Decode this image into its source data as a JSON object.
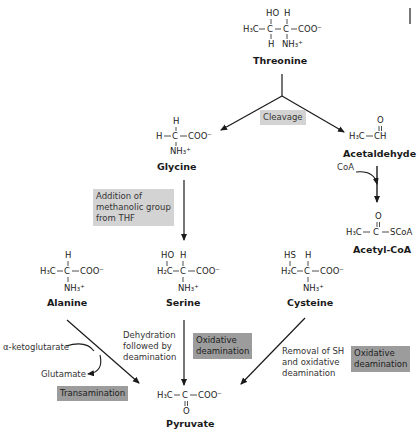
{
  "molecules": {
    "threonine": {
      "name": "Threonine",
      "top": [
        "HO",
        "H"
      ],
      "main": [
        "H₃C",
        "C",
        "C",
        "COO⁻"
      ],
      "bottom": [
        "H",
        "NH₃⁺"
      ]
    },
    "glycine": {
      "name": "Glycine",
      "top": [
        "H"
      ],
      "main": [
        "H",
        "C",
        "COO⁻"
      ],
      "bottom": [
        "NH₃⁺"
      ]
    },
    "acetaldehyde": {
      "name": "Acetaldehyde",
      "top": [
        "O"
      ],
      "main": [
        "H₃C",
        "CH"
      ]
    },
    "acetyl_coa": {
      "name": "Acetyl-CoA",
      "top": [
        "O"
      ],
      "main": [
        "H₃C",
        "C",
        "SCoA"
      ]
    },
    "alanine": {
      "name": "Alanine",
      "top": [
        "H"
      ],
      "main": [
        "H₃C",
        "C",
        "COO⁻"
      ],
      "bottom": [
        "NH₃⁺"
      ]
    },
    "serine": {
      "name": "Serine",
      "top": [
        "HO",
        "H"
      ],
      "main": [
        "H₂C",
        "C",
        "COO⁻"
      ],
      "bottom": [
        "NH₃⁺"
      ]
    },
    "cysteine": {
      "name": "Cysteine",
      "top": [
        "HS",
        "H"
      ],
      "main": [
        "H₂C",
        "C",
        "COO⁻"
      ],
      "bottom": [
        "NH₃⁺"
      ]
    },
    "pyruvate": {
      "name": "Pyruvate",
      "main": [
        "H₃C",
        "C",
        "COO⁻"
      ],
      "bottom": [
        "O"
      ]
    }
  },
  "labels": {
    "cleavage": "Cleavage",
    "addition": [
      "Addition of",
      "methanolic group",
      "from THF"
    ],
    "coa": "CoA",
    "ketoglutarate": "α-ketoglutarate",
    "glutamate": "Glutamate",
    "transamination": "Transamination",
    "dehydration": [
      "Dehydration",
      "followed by",
      "deamination"
    ],
    "oxidative_serine": [
      "Oxidative",
      "deamination"
    ],
    "removal": [
      "Removal of SH",
      "and oxidative",
      "deamination"
    ],
    "oxidative_cysteine": [
      "Oxidative",
      "deamination"
    ]
  },
  "colors": {
    "light_box": "#d3d3d3",
    "dark_box": "#9c9c9c",
    "arrow": "#1a1a1a"
  }
}
